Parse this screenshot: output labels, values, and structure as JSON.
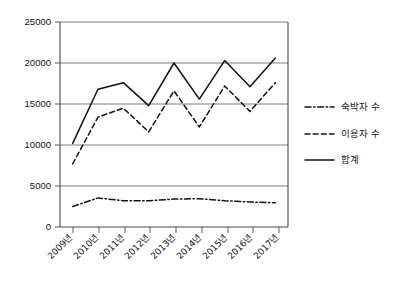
{
  "chart_data": {
    "type": "line",
    "title": "",
    "xlabel": "",
    "ylabel": "",
    "ylim": [
      0,
      25000
    ],
    "ytick_labels": [
      "25000",
      "20000",
      "15000",
      "10000",
      "5000",
      "0"
    ],
    "ytick_values": [
      25000,
      20000,
      15000,
      10000,
      5000,
      0
    ],
    "grid": true,
    "legend_position": "right",
    "categories": [
      "2009년",
      "2010년",
      "2011년",
      "2012년",
      "2013년",
      "2014년",
      "2015년",
      "2016년",
      "2017년"
    ],
    "series": [
      {
        "name": "숙박자 수",
        "style": "dashdot",
        "color": "#111111",
        "values": [
          2500,
          3550,
          3200,
          3200,
          3400,
          3450,
          3200,
          3050,
          2950
        ]
      },
      {
        "name": "이용자 수",
        "style": "dashed",
        "color": "#111111",
        "values": [
          7700,
          13400,
          14500,
          11600,
          16600,
          12200,
          17200,
          14100,
          17600
        ]
      },
      {
        "name": "합계",
        "style": "solid",
        "color": "#111111",
        "values": [
          10200,
          16800,
          17600,
          14800,
          20000,
          15600,
          20300,
          17100,
          20600
        ]
      }
    ]
  },
  "legend": {
    "items": [
      {
        "label": "숙박자 수",
        "style": "dashdot"
      },
      {
        "label": "이용자 수",
        "style": "dashed"
      },
      {
        "label": "합계",
        "style": "solid"
      }
    ]
  }
}
